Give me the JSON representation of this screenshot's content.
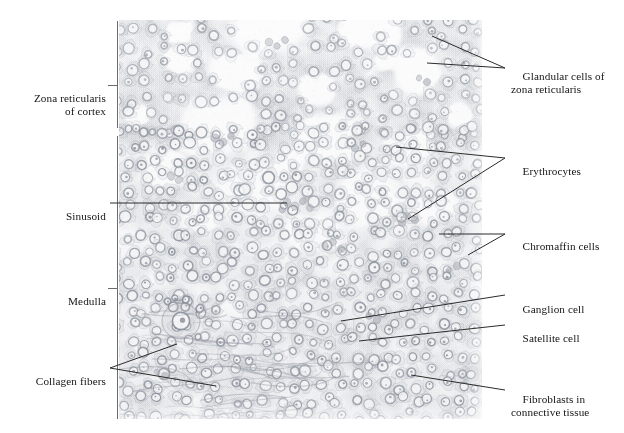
{
  "figure": {
    "kind": "histology-micrograph-figure",
    "background_color": "#ffffff",
    "line_color": "#2b2b2b",
    "text_color": "#141414"
  },
  "micrograph": {
    "name": "adrenal-gland-section",
    "left": 119,
    "top": 20,
    "width": 363,
    "height": 399,
    "tint_base": "#f7f7f8",
    "cell_outline_color": "#9aa0a8",
    "nucleus_color": "#8e949c",
    "erythrocyte_color": "#b9bcc2",
    "regions": [
      {
        "name": "zona-reticularis-of-cortex",
        "y_from": 20,
        "y_to": 128
      },
      {
        "name": "medulla",
        "y_from": 135,
        "y_to": 419
      }
    ]
  },
  "left_labels": [
    {
      "id": "zona-reticularis-of-cortex",
      "lines": [
        "Zona reticularis",
        "of cortex"
      ],
      "text": "Zona reticularis\nof cortex",
      "x": 16,
      "y": 78,
      "width": 90,
      "align": "right"
    },
    {
      "id": "sinusoid",
      "lines": [
        "Sinusoid"
      ],
      "text": "Sinusoid",
      "x": 16,
      "y": 196,
      "width": 90,
      "align": "right"
    },
    {
      "id": "medulla",
      "lines": [
        "Medulla"
      ],
      "text": "Medulla",
      "x": 16,
      "y": 281,
      "width": 90,
      "align": "right"
    },
    {
      "id": "collagen-fibers",
      "lines": [
        "Collagen fibers"
      ],
      "text": "Collagen fibers",
      "x": 8,
      "y": 361,
      "width": 98,
      "align": "right"
    }
  ],
  "right_labels": [
    {
      "id": "glandular-cells-of-zona-reticularis",
      "lines": [
        "Glandular cells of",
        "zona reticularis"
      ],
      "text": "Glandular cells of\nzona reticularis",
      "x": 511,
      "y": 56
    },
    {
      "id": "erythrocytes",
      "lines": [
        "Erythrocytes"
      ],
      "text": "Erythrocytes",
      "x": 511,
      "y": 151
    },
    {
      "id": "chromaffin-cells",
      "lines": [
        "Chromaffin cells"
      ],
      "text": "Chromaffin cells",
      "x": 511,
      "y": 226
    },
    {
      "id": "ganglion-cell",
      "lines": [
        "Ganglion cell"
      ],
      "text": "Ganglion cell",
      "x": 511,
      "y": 289
    },
    {
      "id": "satellite-cell",
      "lines": [
        "Satellite cell"
      ],
      "text": "Satellite cell",
      "x": 511,
      "y": 318
    },
    {
      "id": "fibroblasts-in-connective-tissue",
      "lines": [
        "Fibroblasts in",
        "connective tissue"
      ],
      "text": "Fibroblasts in\nconnective tissue",
      "x": 511,
      "y": 379
    }
  ],
  "brackets": [
    {
      "id": "cortex-bracket",
      "x": 117,
      "y_from": 21,
      "y_to": 128,
      "tick_y": 85,
      "tick_x_from": 108,
      "tick_x_to": 117
    },
    {
      "id": "medulla-bracket",
      "x": 117,
      "y_from": 136,
      "y_to": 419,
      "tick_y": 288,
      "tick_x_from": 108,
      "tick_x_to": 117
    }
  ],
  "leader_lines": [
    {
      "id": "glandular-cells-leader-a",
      "points": "505,68 432,36"
    },
    {
      "id": "glandular-cells-leader-b",
      "points": "505,68 427,63"
    },
    {
      "id": "sinusoid-leader",
      "points": "110,203 287,203"
    },
    {
      "id": "erythrocytes-leader-a",
      "points": "505,158 396,147"
    },
    {
      "id": "erythrocytes-leader-b",
      "points": "505,158 408,219"
    },
    {
      "id": "chromaffin-cells-leader-a",
      "points": "505,234 439,234"
    },
    {
      "id": "chromaffin-cells-leader-b",
      "points": "505,234 468,255"
    },
    {
      "id": "ganglion-cell-leader",
      "points": "505,295 341,321"
    },
    {
      "id": "satellite-cell-leader",
      "points": "505,325 359,341"
    },
    {
      "id": "fibroblasts-leader",
      "points": "505,390 411,375"
    },
    {
      "id": "collagen-fibers-leader-a",
      "points": "110,368 177,344"
    },
    {
      "id": "collagen-fibers-leader-b",
      "points": "110,368 216,386"
    }
  ]
}
